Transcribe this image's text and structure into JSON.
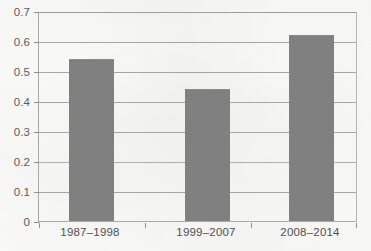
{
  "chart_data": {
    "type": "bar",
    "title": "",
    "subtitle": "",
    "xlabel": "",
    "ylabel": "",
    "categories": [
      "1987–1998",
      "1999–2007",
      "2008–2014"
    ],
    "values": [
      0.545,
      0.445,
      0.625
    ],
    "ylim": [
      0,
      0.7
    ],
    "ytick_labels": [
      "0.7",
      "0.6",
      "0.5",
      "0.4",
      "0.3",
      "0.2",
      "0.1",
      "0"
    ],
    "ytick_values": [
      0.7,
      0.6,
      0.5,
      0.4,
      0.3,
      0.2,
      0.1,
      0
    ],
    "grid": "horizontal",
    "legend": "none",
    "annotations": [],
    "series": [
      {
        "name": "",
        "values": [
          0.545,
          0.445,
          0.625
        ]
      }
    ]
  },
  "style": {
    "bar_color": "#808080",
    "gridline_color": "#a6a6a6",
    "frame_color": "#a9a9a9",
    "label_color": "#4f4f4f",
    "background_color": "#fdfdfc"
  }
}
